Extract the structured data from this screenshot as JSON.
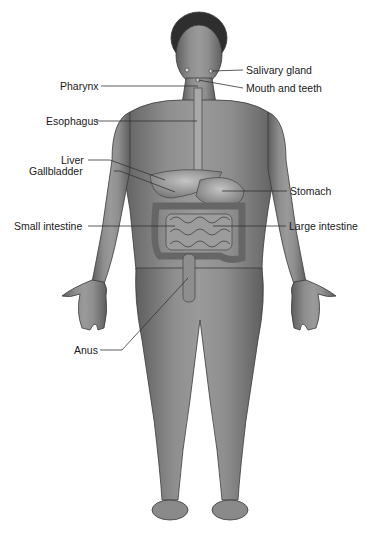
{
  "diagram": {
    "type": "anatomical-labeled-illustration",
    "colors": {
      "skin": "#8a8a8a",
      "skin_dark": "#5a5a5a",
      "organ": "#b0b0b0",
      "leader": "#333333",
      "text": "#1a1a1a"
    },
    "labels": [
      {
        "id": "salivary-gland",
        "text": "Salivary gland",
        "side": "right",
        "x": 246,
        "y": 64
      },
      {
        "id": "mouth-and-teeth",
        "text": "Mouth and teeth",
        "side": "right",
        "x": 246,
        "y": 82
      },
      {
        "id": "pharynx",
        "text": "Pharynx",
        "side": "left",
        "x": 60,
        "y": 80
      },
      {
        "id": "esophagus",
        "text": "Esophagus",
        "side": "left",
        "x": 46,
        "y": 115
      },
      {
        "id": "liver",
        "text": "Liver",
        "side": "left",
        "x": 61,
        "y": 154
      },
      {
        "id": "gallbladder",
        "text": "Gallbladder",
        "side": "left",
        "x": 29,
        "y": 165
      },
      {
        "id": "stomach",
        "text": "Stomach",
        "side": "right",
        "x": 290,
        "y": 185
      },
      {
        "id": "small-intestine",
        "text": "Small intestine",
        "side": "left",
        "x": 14,
        "y": 220
      },
      {
        "id": "large-intestine",
        "text": "Large intestine",
        "side": "right",
        "x": 289,
        "y": 220
      },
      {
        "id": "anus",
        "text": "Anus",
        "side": "left",
        "x": 74,
        "y": 344
      }
    ]
  }
}
